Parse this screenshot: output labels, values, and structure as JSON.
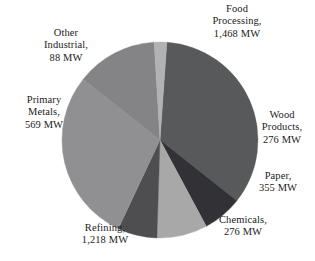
{
  "chart_data": {
    "type": "pie",
    "title": "",
    "subtitle": "",
    "xlabel": "",
    "ylabel": "",
    "unit": "MW",
    "legend_position": "none",
    "grid": false,
    "total": 4250,
    "categories": [
      "Food Processing",
      "Wood Products",
      "Paper",
      "Chemicals",
      "Refining",
      "Primary Metals",
      "Other Industrial"
    ],
    "values": [
      1468,
      276,
      355,
      276,
      1218,
      569,
      88
    ],
    "colors": [
      "#58595b",
      "#323236",
      "#a8a8a8",
      "#4e4e50",
      "#909092",
      "#848487",
      "#b2b2b2"
    ],
    "slices": [
      {
        "name": "Food Processing",
        "value": 1468,
        "label": "Food\nProcessing,\n1,468 MW",
        "color": "#58595b",
        "start_angle": 4,
        "end_angle": 128.4
      },
      {
        "name": "Wood Products",
        "value": 276,
        "label": "Wood\nProducts,\n276 MW",
        "color": "#323236",
        "start_angle": 128.4,
        "end_angle": 151.8
      },
      {
        "name": "Paper",
        "value": 355,
        "label": "Paper,\n355 MW",
        "color": "#a8a8a8",
        "start_angle": 151.8,
        "end_angle": 181.8
      },
      {
        "name": "Chemicals",
        "value": 276,
        "label": "Chemicals,\n276 MW",
        "color": "#4e4e50",
        "start_angle": 181.8,
        "end_angle": 205.2
      },
      {
        "name": "Refining",
        "value": 1218,
        "label": "Refining,\n1,218 MW",
        "color": "#909092",
        "start_angle": 205.2,
        "end_angle": 308.4
      },
      {
        "name": "Primary Metals",
        "value": 569,
        "label": "Primary\nMetals,\n569 MW",
        "color": "#848487",
        "start_angle": 308.4,
        "end_angle": 356.6
      },
      {
        "name": "Other Industrial",
        "value": 88,
        "label": "Other\nIndustrial,\n88 MW",
        "color": "#b2b2b2",
        "start_angle": 356.6,
        "end_angle": 364
      }
    ],
    "geometry": {
      "center_x": 160,
      "center_y": 140,
      "radius": 98
    }
  },
  "labels": {
    "food_processing": "Food\nProcessing,\n1,468 MW",
    "other_industrial": "Other\nIndustrial,\n88 MW",
    "primary_metals": "Primary\nMetals,\n569 MW",
    "wood_products": "Wood\nProducts,\n276 MW",
    "paper": "Paper,\n355 MW",
    "chemicals": "Chemicals,\n276 MW",
    "refining": "Refining,\n1,218 MW"
  }
}
